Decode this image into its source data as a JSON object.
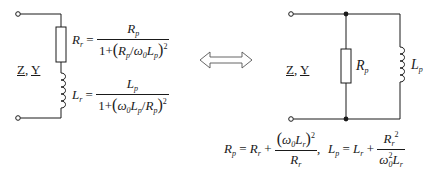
{
  "left_circuit": {
    "title": "Series RL equivalent",
    "terminal_label": {
      "z": "Z",
      "sep": ",",
      "y": "Y"
    },
    "resistor_label": {
      "sym": "R",
      "sub": "r"
    },
    "inductor_label": {
      "sym": "L",
      "sub": "r"
    }
  },
  "right_circuit": {
    "title": "Parallel RL equivalent",
    "terminal_label": {
      "z": "Z",
      "sep": ",",
      "y": "Y"
    },
    "resistor_label": {
      "sym": "R",
      "sub": "p"
    },
    "inductor_label": {
      "sym": "L",
      "sub": "p"
    }
  },
  "equivalence_arrow": "double-hollow-arrow",
  "formulas": {
    "Rr": {
      "lhs": {
        "sym": "R",
        "sub": "r"
      },
      "eq": "=",
      "num": {
        "sym": "R",
        "sub": "p"
      },
      "den_prefix": "1+",
      "den_inner": [
        {
          "sym": "R",
          "sub": "p"
        },
        {
          "op": "/"
        },
        {
          "sym": "ω",
          "sub": "0"
        },
        {
          "sym": "L",
          "sub": "p"
        }
      ],
      "exp": "2"
    },
    "Lr": {
      "lhs": {
        "sym": "L",
        "sub": "r"
      },
      "eq": "=",
      "num": {
        "sym": "L",
        "sub": "p"
      },
      "den_prefix": "1+",
      "den_inner": [
        {
          "sym": "ω",
          "sub": "0"
        },
        {
          "sym": "L",
          "sub": "p"
        },
        {
          "op": "/"
        },
        {
          "sym": "R",
          "sub": "p"
        }
      ],
      "exp": "2"
    },
    "Rp": {
      "lhs": {
        "sym": "R",
        "sub": "p"
      },
      "eq": "=",
      "term1": {
        "sym": "R",
        "sub": "r"
      },
      "plus": "+",
      "num": "(ω0Lr)^2",
      "den": {
        "sym": "R",
        "sub": "r"
      },
      "sep": ","
    },
    "Lp": {
      "lhs": {
        "sym": "L",
        "sub": "p"
      },
      "eq": "=",
      "term1": {
        "sym": "L",
        "sub": "r"
      },
      "plus": "+",
      "num": "Rr^2",
      "den": "ω0^2 Lr"
    }
  },
  "colors": {
    "line": "#1a1a1a",
    "background": "#ffffff",
    "arrow": "#555555"
  },
  "text": {
    "R": "R",
    "L": "L",
    "omega": "ω",
    "r": "r",
    "p": "p",
    "zero": "0",
    "two": "2",
    "eq": "=",
    "plus": "+",
    "one_plus": "1+",
    "slash": "/",
    "lparen": "(",
    "rparen": ")",
    "comma": ","
  }
}
